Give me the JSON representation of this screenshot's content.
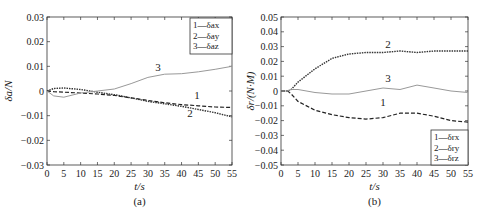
{
  "chart_data": [
    {
      "type": "line",
      "panel_label": "(a)",
      "title": "",
      "xlabel": "t/s",
      "ylabel": "δa/N",
      "xlim": [
        0,
        55
      ],
      "ylim": [
        -0.03,
        0.03
      ],
      "x_ticks": [
        "0",
        "5",
        "10",
        "15",
        "20",
        "25",
        "30",
        "35",
        "40",
        "45",
        "50",
        "55"
      ],
      "y_ticks": [
        "0.03",
        "0.02",
        "0.01",
        "0",
        "-0.01",
        "-0.02",
        "-0.03"
      ],
      "legend": {
        "position": "upper right",
        "entries": [
          "1—δax",
          "2—δay",
          "3—δaz"
        ]
      },
      "curve_labels": [
        "1",
        "2",
        "3"
      ],
      "x": [
        0,
        2,
        5,
        10,
        15,
        20,
        25,
        30,
        35,
        40,
        45,
        50,
        55
      ],
      "series": [
        {
          "name": "1—δax",
          "style": "dashed",
          "values": [
            0,
            -0.0003,
            -0.0005,
            -0.0008,
            -0.0012,
            -0.0018,
            -0.0028,
            -0.0038,
            -0.0048,
            -0.0055,
            -0.006,
            -0.0065,
            -0.0067
          ]
        },
        {
          "name": "2—δay",
          "style": "dash-dot",
          "values": [
            0,
            0.001,
            0.0012,
            0.0006,
            -0.0005,
            -0.0015,
            -0.0028,
            -0.0042,
            -0.0052,
            -0.0062,
            -0.0075,
            -0.0088,
            -0.0105
          ]
        },
        {
          "name": "3—δaz",
          "style": "solid-gray",
          "values": [
            0,
            -0.002,
            -0.0025,
            -0.0008,
            0.0,
            0.0008,
            0.003,
            0.0055,
            0.0068,
            0.007,
            0.0078,
            0.0088,
            0.01
          ]
        }
      ]
    },
    {
      "type": "line",
      "panel_label": "(b)",
      "title": "",
      "xlabel": "t/s",
      "ylabel": "δr/(N·M)",
      "xlim": [
        0,
        55
      ],
      "ylim": [
        -0.05,
        0.05
      ],
      "x_ticks": [
        "0",
        "5",
        "10",
        "15",
        "20",
        "25",
        "30",
        "35",
        "40",
        "45",
        "50",
        "55"
      ],
      "y_ticks": [
        "0.05",
        "0.04",
        "0.03",
        "0.02",
        "0.01",
        "0",
        "-0.01",
        "-0.02",
        "-0.03",
        "-0.04",
        "-0.05"
      ],
      "legend": {
        "position": "lower right",
        "entries": [
          "1—δrx",
          "2—δry",
          "3—δrz"
        ]
      },
      "curve_labels": [
        "1",
        "2",
        "3"
      ],
      "x": [
        0,
        2,
        3,
        5,
        10,
        15,
        20,
        25,
        30,
        35,
        40,
        45,
        50,
        55
      ],
      "series": [
        {
          "name": "1—δrx",
          "style": "dashed",
          "values": [
            0,
            0,
            -0.002,
            -0.007,
            -0.013,
            -0.016,
            -0.018,
            -0.019,
            -0.018,
            -0.015,
            -0.015,
            -0.017,
            -0.02,
            -0.021
          ]
        },
        {
          "name": "2—δry",
          "style": "dotted-dark",
          "values": [
            0,
            0,
            0.001,
            0.006,
            0.015,
            0.022,
            0.025,
            0.026,
            0.026,
            0.027,
            0.026,
            0.027,
            0.027,
            0.027
          ]
        },
        {
          "name": "3—δrz",
          "style": "solid-gray",
          "values": [
            0,
            0,
            0.001,
            0.001,
            -0.001,
            -0.002,
            -0.002,
            0.0,
            0.002,
            0.001,
            0.004,
            0.002,
            0.0,
            -0.001
          ]
        }
      ]
    }
  ]
}
